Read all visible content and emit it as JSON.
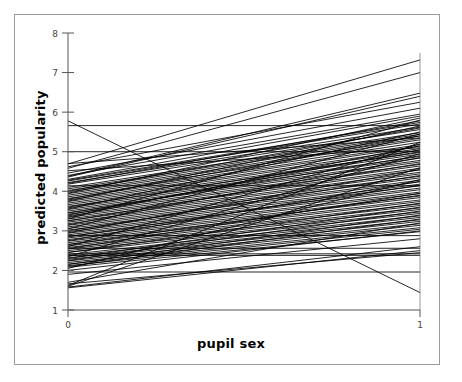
{
  "chart_data": {
    "type": "line",
    "title": "",
    "subtitle": "",
    "xlabel": "pupil sex",
    "ylabel": "predicted popularity",
    "xlim": [
      0,
      1
    ],
    "ylim": [
      1,
      8
    ],
    "xticks": [
      0,
      1
    ],
    "xticklabels": [
      "0",
      "1"
    ],
    "yticks": [
      1,
      2,
      3,
      4,
      5,
      6,
      7,
      8
    ],
    "yticklabels": [
      "1",
      "2",
      "3",
      "4",
      "5",
      "6",
      "7",
      "8"
    ],
    "grid": false,
    "legend": null,
    "legend_position": "none",
    "annotations": [],
    "x": [
      0,
      1
    ],
    "series": [
      {
        "name": "school-01",
        "values": [
          5.78,
          1.44
        ]
      },
      {
        "name": "school-02",
        "values": [
          5.66,
          5.66
        ]
      },
      {
        "name": "school-03",
        "values": [
          4.69,
          7.32
        ]
      },
      {
        "name": "school-04",
        "values": [
          4.38,
          6.48
        ]
      },
      {
        "name": "school-05",
        "values": [
          4.36,
          6.4
        ]
      },
      {
        "name": "school-06",
        "values": [
          4.3,
          5.9
        ]
      },
      {
        "name": "school-07",
        "values": [
          4.28,
          5.74
        ]
      },
      {
        "name": "school-08",
        "values": [
          4.26,
          5.7
        ]
      },
      {
        "name": "school-09",
        "values": [
          4.22,
          5.62
        ]
      },
      {
        "name": "school-10",
        "values": [
          4.18,
          5.56
        ]
      },
      {
        "name": "school-11",
        "values": [
          4.14,
          4.14
        ]
      },
      {
        "name": "school-12",
        "values": [
          4.1,
          5.48
        ]
      },
      {
        "name": "school-13",
        "values": [
          4.06,
          5.44
        ]
      },
      {
        "name": "school-14",
        "values": [
          4.02,
          5.4
        ]
      },
      {
        "name": "school-15",
        "values": [
          3.98,
          5.34
        ]
      },
      {
        "name": "school-16",
        "values": [
          3.94,
          5.3
        ]
      },
      {
        "name": "school-17",
        "values": [
          3.9,
          5.24
        ]
      },
      {
        "name": "school-18",
        "values": [
          3.86,
          5.18
        ]
      },
      {
        "name": "school-19",
        "values": [
          3.82,
          5.14
        ]
      },
      {
        "name": "school-20",
        "values": [
          3.78,
          5.08
        ]
      },
      {
        "name": "school-21",
        "values": [
          3.74,
          5.04
        ]
      },
      {
        "name": "school-22",
        "values": [
          3.7,
          4.98
        ]
      },
      {
        "name": "school-23",
        "values": [
          3.66,
          4.94
        ]
      },
      {
        "name": "school-24",
        "values": [
          3.62,
          4.88
        ]
      },
      {
        "name": "school-25",
        "values": [
          3.58,
          4.84
        ]
      },
      {
        "name": "school-26",
        "values": [
          3.54,
          4.78
        ]
      },
      {
        "name": "school-27",
        "values": [
          3.5,
          4.74
        ]
      },
      {
        "name": "school-28",
        "values": [
          3.46,
          4.68
        ]
      },
      {
        "name": "school-29",
        "values": [
          3.42,
          4.64
        ]
      },
      {
        "name": "school-30",
        "values": [
          3.38,
          4.58
        ]
      },
      {
        "name": "school-31",
        "values": [
          3.34,
          4.54
        ]
      },
      {
        "name": "school-32",
        "values": [
          3.3,
          4.48
        ]
      },
      {
        "name": "school-33",
        "values": [
          3.26,
          4.44
        ]
      },
      {
        "name": "school-34",
        "values": [
          3.22,
          4.38
        ]
      },
      {
        "name": "school-35",
        "values": [
          3.18,
          4.34
        ]
      },
      {
        "name": "school-36",
        "values": [
          3.14,
          4.28
        ]
      },
      {
        "name": "school-37",
        "values": [
          3.1,
          4.24
        ]
      },
      {
        "name": "school-38",
        "values": [
          3.06,
          4.18
        ]
      },
      {
        "name": "school-39",
        "values": [
          3.02,
          4.14
        ]
      },
      {
        "name": "school-40",
        "values": [
          2.98,
          4.08
        ]
      },
      {
        "name": "school-41",
        "values": [
          2.94,
          4.04
        ]
      },
      {
        "name": "school-42",
        "values": [
          2.9,
          3.98
        ]
      },
      {
        "name": "school-43",
        "values": [
          2.88,
          2.88
        ]
      },
      {
        "name": "school-44",
        "values": [
          2.86,
          3.94
        ]
      },
      {
        "name": "school-45",
        "values": [
          2.82,
          3.88
        ]
      },
      {
        "name": "school-46",
        "values": [
          2.78,
          3.84
        ]
      },
      {
        "name": "school-47",
        "values": [
          2.74,
          3.78
        ]
      },
      {
        "name": "school-48",
        "values": [
          2.7,
          3.74
        ]
      },
      {
        "name": "school-49",
        "values": [
          2.66,
          3.68
        ]
      },
      {
        "name": "school-50",
        "values": [
          2.62,
          3.64
        ]
      },
      {
        "name": "school-51",
        "values": [
          2.58,
          3.58
        ]
      },
      {
        "name": "school-52",
        "values": [
          2.56,
          2.56
        ]
      },
      {
        "name": "school-53",
        "values": [
          2.54,
          3.54
        ]
      },
      {
        "name": "school-54",
        "values": [
          2.5,
          3.48
        ]
      },
      {
        "name": "school-55",
        "values": [
          2.46,
          3.44
        ]
      },
      {
        "name": "school-56",
        "values": [
          2.42,
          2.42
        ]
      },
      {
        "name": "school-57",
        "values": [
          2.4,
          3.38
        ]
      },
      {
        "name": "school-58",
        "values": [
          2.36,
          3.34
        ]
      },
      {
        "name": "school-59",
        "values": [
          2.32,
          3.28
        ]
      },
      {
        "name": "school-60",
        "values": [
          2.28,
          3.24
        ]
      },
      {
        "name": "school-61",
        "values": [
          2.24,
          3.18
        ]
      },
      {
        "name": "school-62",
        "values": [
          2.2,
          3.14
        ]
      },
      {
        "name": "school-63",
        "values": [
          2.16,
          3.08
        ]
      },
      {
        "name": "school-64",
        "values": [
          2.12,
          3.04
        ]
      },
      {
        "name": "school-65",
        "values": [
          2.08,
          2.98
        ]
      },
      {
        "name": "school-66",
        "values": [
          1.96,
          1.96
        ]
      },
      {
        "name": "school-67",
        "values": [
          1.62,
          5.24
        ]
      },
      {
        "name": "school-68",
        "values": [
          1.6,
          4.6
        ]
      },
      {
        "name": "school-69",
        "values": [
          1.58,
          2.6
        ]
      },
      {
        "name": "school-70",
        "values": [
          1.56,
          2.5
        ]
      },
      {
        "name": "school-71",
        "values": [
          4.58,
          7.0
        ]
      },
      {
        "name": "school-72",
        "values": [
          4.46,
          6.1
        ]
      },
      {
        "name": "school-73",
        "values": [
          3.3,
          5.8
        ]
      },
      {
        "name": "school-74",
        "values": [
          3.05,
          5.45
        ]
      },
      {
        "name": "school-75",
        "values": [
          2.6,
          5.2
        ]
      },
      {
        "name": "school-76",
        "values": [
          2.35,
          4.95
        ]
      },
      {
        "name": "school-77",
        "values": [
          4.7,
          5.35
        ]
      },
      {
        "name": "school-78",
        "values": [
          4.52,
          5.1
        ]
      },
      {
        "name": "school-79",
        "values": [
          3.4,
          5.05
        ]
      },
      {
        "name": "school-80",
        "values": [
          2.05,
          4.3
        ]
      },
      {
        "name": "school-81",
        "values": [
          2.0,
          3.0
        ]
      },
      {
        "name": "school-82",
        "values": [
          1.7,
          3.2
        ]
      },
      {
        "name": "school-83",
        "values": [
          4.62,
          6.25
        ]
      },
      {
        "name": "school-84",
        "values": [
          3.95,
          5.85
        ]
      },
      {
        "name": "school-85",
        "values": [
          3.75,
          5.65
        ]
      },
      {
        "name": "school-86",
        "values": [
          3.55,
          5.5
        ]
      },
      {
        "name": "school-87",
        "values": [
          3.35,
          5.15
        ]
      },
      {
        "name": "school-88",
        "values": [
          3.15,
          4.85
        ]
      },
      {
        "name": "school-89",
        "values": [
          2.95,
          4.55
        ]
      },
      {
        "name": "school-90",
        "values": [
          2.75,
          4.25
        ]
      },
      {
        "name": "school-91",
        "values": [
          2.55,
          3.95
        ]
      },
      {
        "name": "school-92",
        "values": [
          2.3,
          3.6
        ]
      },
      {
        "name": "school-93",
        "values": [
          2.1,
          3.3
        ]
      },
      {
        "name": "school-94",
        "values": [
          1.9,
          2.8
        ]
      },
      {
        "name": "school-95",
        "values": [
          4.4,
          5.95
        ]
      },
      {
        "name": "school-96",
        "values": [
          4.2,
          5.78
        ]
      },
      {
        "name": "school-97",
        "values": [
          4.0,
          5.6
        ]
      },
      {
        "name": "school-98",
        "values": [
          3.8,
          5.4
        ]
      },
      {
        "name": "school-99",
        "values": [
          3.6,
          5.0
        ]
      },
      {
        "name": "school-100",
        "values": [
          3.45,
          4.9
        ]
      },
      {
        "name": "school-101",
        "values": [
          3.25,
          4.7
        ]
      },
      {
        "name": "school-102",
        "values": [
          3.0,
          4.4
        ]
      },
      {
        "name": "school-103",
        "values": [
          2.85,
          4.15
        ]
      },
      {
        "name": "school-104",
        "values": [
          2.65,
          3.9
        ]
      },
      {
        "name": "school-105",
        "values": [
          2.45,
          3.7
        ]
      },
      {
        "name": "school-106",
        "values": [
          2.25,
          3.5
        ]
      },
      {
        "name": "school-107",
        "values": [
          2.15,
          3.4
        ]
      },
      {
        "name": "school-108",
        "values": [
          1.66,
          2.45
        ]
      },
      {
        "name": "school-109",
        "values": [
          5.0,
          5.0
        ]
      },
      {
        "name": "school-110",
        "values": [
          2.38,
          2.38
        ]
      }
    ]
  },
  "style": {
    "line_color": "#000000",
    "axis_color": "#555555",
    "frame_color": "#9a9a9a",
    "background": "#ffffff",
    "tick_label_color": "#444444"
  }
}
